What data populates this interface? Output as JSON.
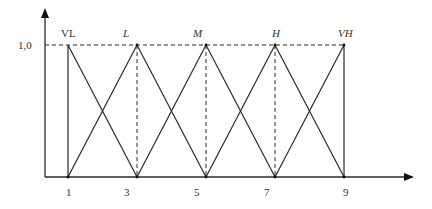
{
  "diagram": {
    "type": "fuzzy-membership-functions",
    "colors": {
      "line": "#2a2a2a",
      "background": "#ffffff",
      "text": "#333333"
    },
    "y_axis": {
      "label_value": "1,0"
    },
    "x_axis": {
      "ticks": [
        "1",
        "3",
        "5",
        "7",
        "9"
      ]
    },
    "sets": [
      {
        "label": "VL",
        "italic": false,
        "shape": [
          1,
          1,
          3
        ]
      },
      {
        "label": "L",
        "italic": true,
        "shape": [
          1,
          3,
          5
        ]
      },
      {
        "label": "M",
        "italic": true,
        "shape": [
          3,
          5,
          7
        ]
      },
      {
        "label": "H",
        "italic": true,
        "shape": [
          5,
          7,
          9
        ]
      },
      {
        "label": "VH",
        "italic": true,
        "shape": [
          7,
          9,
          9
        ]
      }
    ]
  }
}
